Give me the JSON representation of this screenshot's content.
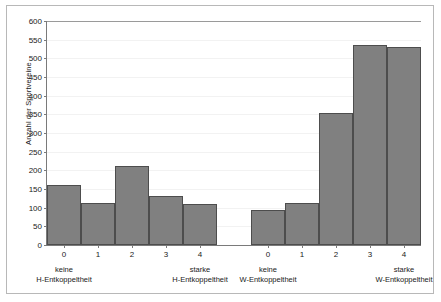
{
  "chart_data": {
    "type": "bar",
    "title": "",
    "xlabel": "",
    "ylabel": "Anzahl der Sportvereine",
    "ylim": [
      0,
      600
    ],
    "ytick_labels": [
      "600",
      "550",
      "500",
      "450",
      "400",
      "350",
      "300",
      "250",
      "200",
      "150",
      "100",
      "50",
      "0"
    ],
    "yticks": [
      600,
      550,
      500,
      450,
      400,
      350,
      300,
      250,
      200,
      150,
      100,
      50,
      0
    ],
    "grid": true,
    "legend": "none",
    "groups": [
      {
        "id": "h-entkoppeltheit",
        "left_caption_line1": "keine",
        "left_caption_line2": "H-Entkoppeltheit",
        "right_caption_line1": "starke",
        "right_caption_line2": "H-Entkoppeltheit",
        "categories": [
          "0",
          "1",
          "2",
          "3",
          "4"
        ],
        "values": [
          160,
          112,
          212,
          130,
          110
        ]
      },
      {
        "id": "w-entkoppeltheit",
        "left_caption_line1": "keine",
        "left_caption_line2": "W-Entkoppeltheit",
        "right_caption_line1": "starke",
        "right_caption_line2": "W-Entkoppeltheit",
        "categories": [
          "0",
          "1",
          "2",
          "3",
          "4"
        ],
        "values": [
          95,
          112,
          353,
          537,
          531
        ]
      }
    ],
    "colors": {
      "bar_fill": "#808080",
      "bar_border": "#4d4d4d",
      "axis": "#7a7a7a",
      "gridline": "#f2f2f2",
      "frame": "#b8b8b8",
      "text": "#1a1a1a"
    }
  }
}
